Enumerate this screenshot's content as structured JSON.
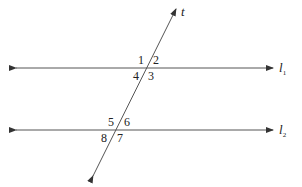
{
  "diagram": {
    "type": "parallel-lines-cut-by-transversal",
    "lines": {
      "l1": {
        "label": "l",
        "subscript": "1"
      },
      "l2": {
        "label": "l",
        "subscript": "2"
      },
      "transversal": {
        "label": "t"
      }
    },
    "angles_at_l1": {
      "a1": "1",
      "a2": "2",
      "a3": "3",
      "a4": "4"
    },
    "angles_at_l2": {
      "a5": "5",
      "a6": "6",
      "a7": "7",
      "a8": "8"
    },
    "colors": {
      "line": "#555555",
      "text": "#222222",
      "background": "#ffffff"
    }
  }
}
